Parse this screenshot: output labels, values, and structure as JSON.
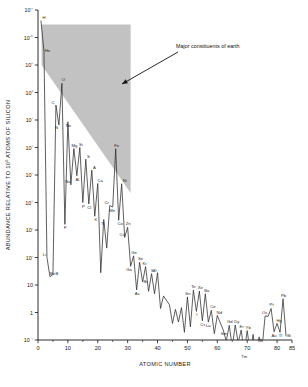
{
  "figure": {
    "title": "",
    "background_color": "#ffffff",
    "width": 308,
    "height": 387
  },
  "annotation": {
    "label": "Major constituents of earth",
    "arrow_from_x": 178,
    "arrow_from_y": 52,
    "arrow_to_x": 122,
    "arrow_to_y": 84
  },
  "axis_titles": {
    "x": "ATOMIC NUMBER",
    "y_pre": "ABUNDANCE RELATIVE TO 10",
    "y_exp": "6",
    "y_post": " ATOMS OF SILICON"
  },
  "shaded_region": {
    "name": "Major constituents of earth",
    "color": "#b4b4b4",
    "opacity": 0.82
  },
  "chart_data": {
    "type": "line",
    "title": "",
    "subtitle": "",
    "xlabel": "ATOMIC NUMBER",
    "ylabel": "ABUNDANCE RELATIVE TO 10^6 ATOMS OF SILICON",
    "yscale": "log",
    "xlim": [
      0,
      85
    ],
    "ylim": [
      0.1,
      100000000000
    ],
    "grid": false,
    "legend": null,
    "x_ticks": [
      0,
      10,
      20,
      30,
      40,
      50,
      60,
      70,
      80,
      85
    ],
    "x_tick_labels": [
      "0",
      "10",
      "20",
      "30",
      "40",
      "50",
      "60",
      "70",
      "80",
      "85"
    ],
    "x_minor_ticks": [
      5,
      15,
      25,
      35,
      45,
      55,
      65,
      75
    ],
    "y_ticks": [
      0.1,
      1,
      10,
      100,
      1000,
      10000,
      100000,
      1000000,
      10000000,
      100000000,
      1000000000,
      10000000000,
      100000000000
    ],
    "y_tick_labels": [
      "10⁻¹",
      "1",
      "10",
      "10²",
      "10³",
      "10⁴",
      "10⁵",
      "10⁶",
      "10⁷",
      "10⁸",
      "10⁹",
      "10¹⁰",
      "10¹¹"
    ],
    "series": [
      {
        "name": "Cosmic abundance of the elements",
        "x": [
          1,
          2,
          3,
          4,
          5,
          6,
          7,
          8,
          9,
          10,
          11,
          12,
          13,
          14,
          15,
          16,
          17,
          18,
          19,
          20,
          21,
          22,
          23,
          24,
          25,
          26,
          27,
          28,
          29,
          30,
          31,
          32,
          33,
          34,
          35,
          36,
          37,
          38,
          39,
          40,
          41,
          42,
          44,
          45,
          46,
          47,
          48,
          49,
          50,
          51,
          52,
          53,
          54,
          55,
          56,
          57,
          58,
          59,
          60,
          62,
          63,
          64,
          65,
          66,
          67,
          68,
          69,
          70,
          71,
          72,
          73,
          74,
          75,
          76,
          77,
          78,
          79,
          80,
          81,
          82,
          83
        ],
        "values": [
          40000000000,
          3100000000,
          100,
          20,
          24,
          35000000,
          6600000,
          215000000,
          1600,
          8600000,
          44000,
          915000,
          94000,
          1000000,
          10000,
          375000,
          8850,
          150000,
          3160,
          49000,
          28,
          2400,
          220,
          7800,
          6850,
          900000,
          2250,
          48000,
          540,
          1250,
          48,
          115,
          6.6,
          67,
          13,
          47,
          5.9,
          26,
          4.8,
          28,
          1.4,
          4,
          1.9,
          0.4,
          1.3,
          0.45,
          1.5,
          0.19,
          3.7,
          0.3,
          6.5,
          1.1,
          6,
          0.5,
          4.8,
          0.45,
          1.2,
          0.17,
          0.78,
          0.23,
          0.09,
          0.34,
          0.055,
          0.35,
          0.08,
          0.23,
          0.035,
          0.22,
          0.035,
          0.16,
          0.02,
          0.13,
          0.055,
          0.75,
          0.72,
          1.4,
          0.2,
          0.4,
          0.19,
          3.15,
          0.14
        ]
      }
    ],
    "point_labels": [
      {
        "element": "H",
        "z": 1,
        "value": 40000000000
      },
      {
        "element": "He",
        "z": 2,
        "value": 3100000000
      },
      {
        "element": "Li",
        "z": 3,
        "value": 100
      },
      {
        "element": "Be",
        "z": 4,
        "value": 20
      },
      {
        "element": "B",
        "z": 5,
        "value": 24
      },
      {
        "element": "C",
        "z": 6,
        "value": 35000000
      },
      {
        "element": "N",
        "z": 7,
        "value": 6600000
      },
      {
        "element": "O",
        "z": 8,
        "value": 215000000
      },
      {
        "element": "F",
        "z": 9,
        "value": 1600
      },
      {
        "element": "Ne",
        "z": 10,
        "value": 8600000
      },
      {
        "element": "Na",
        "z": 11,
        "value": 44000
      },
      {
        "element": "Mg",
        "z": 12,
        "value": 915000
      },
      {
        "element": "Al",
        "z": 13,
        "value": 94000
      },
      {
        "element": "Si",
        "z": 14,
        "value": 1000000
      },
      {
        "element": "P",
        "z": 15,
        "value": 10000
      },
      {
        "element": "S",
        "z": 16,
        "value": 375000
      },
      {
        "element": "Cl",
        "z": 17,
        "value": 8850
      },
      {
        "element": "A",
        "z": 18,
        "value": 150000
      },
      {
        "element": "K",
        "z": 19,
        "value": 3160
      },
      {
        "element": "Ca",
        "z": 20,
        "value": 49000
      },
      {
        "element": "Ti",
        "z": 22,
        "value": 2400
      },
      {
        "element": "Cr",
        "z": 24,
        "value": 7800
      },
      {
        "element": "Mn",
        "z": 25,
        "value": 6850
      },
      {
        "element": "Fe",
        "z": 26,
        "value": 900000
      },
      {
        "element": "Co",
        "z": 27,
        "value": 2250
      },
      {
        "element": "Ni",
        "z": 28,
        "value": 48000
      },
      {
        "element": "Cu",
        "z": 29,
        "value": 540
      },
      {
        "element": "Zn",
        "z": 30,
        "value": 1250
      },
      {
        "element": "Ga",
        "z": 31,
        "value": 48
      },
      {
        "element": "Ge",
        "z": 32,
        "value": 115
      },
      {
        "element": "As",
        "z": 33,
        "value": 6.6
      },
      {
        "element": "Se",
        "z": 34,
        "value": 67
      },
      {
        "element": "Br",
        "z": 35,
        "value": 13
      },
      {
        "element": "Kr",
        "z": 36,
        "value": 47
      },
      {
        "element": "Sr",
        "z": 38,
        "value": 26
      },
      {
        "element": "Zr",
        "z": 40,
        "value": 28
      },
      {
        "element": "Sn",
        "z": 50,
        "value": 3.7
      },
      {
        "element": "Te",
        "z": 52,
        "value": 6.5
      },
      {
        "element": "I",
        "z": 53,
        "value": 1.1
      },
      {
        "element": "Xe",
        "z": 54,
        "value": 6
      },
      {
        "element": "Cs",
        "z": 55,
        "value": 0.5
      },
      {
        "element": "Ba",
        "z": 56,
        "value": 4.8
      },
      {
        "element": "La",
        "z": 57,
        "value": 0.45
      },
      {
        "element": "Ce",
        "z": 58,
        "value": 1.2
      },
      {
        "element": "Nd",
        "z": 60,
        "value": 0.78
      },
      {
        "element": "Sm",
        "z": 62,
        "value": 0.23
      },
      {
        "element": "Gd",
        "z": 64,
        "value": 0.34
      },
      {
        "element": "Dy",
        "z": 66,
        "value": 0.35
      },
      {
        "element": "Er",
        "z": 68,
        "value": 0.23
      },
      {
        "element": "Tm",
        "z": 69,
        "value": 0.035
      },
      {
        "element": "Yb",
        "z": 70,
        "value": 0.22
      },
      {
        "element": "W",
        "z": 74,
        "value": 0.13
      },
      {
        "element": "Os",
        "z": 76,
        "value": 0.72
      },
      {
        "element": "Pt",
        "z": 78,
        "value": 1.4
      },
      {
        "element": "Au",
        "z": 79,
        "value": 0.2
      },
      {
        "element": "Hg",
        "z": 80,
        "value": 0.4
      },
      {
        "element": "Tl",
        "z": 81,
        "value": 0.19
      },
      {
        "element": "Pb",
        "z": 82,
        "value": 3.15
      },
      {
        "element": "Bi",
        "z": 83,
        "value": 0.14
      }
    ]
  }
}
